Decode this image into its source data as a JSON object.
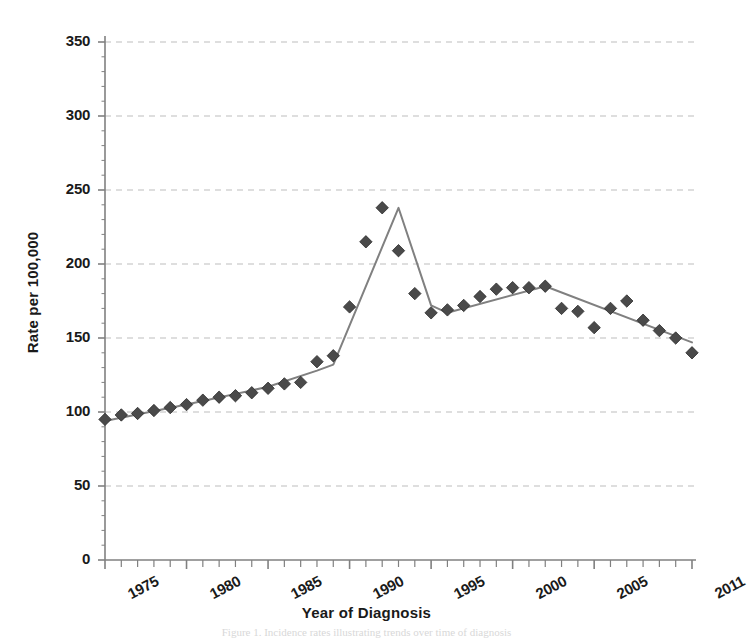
{
  "figure": {
    "background": "#ffffff",
    "caption_remnant": "Figure 1. Incidence rates illustrating trends over time of diagnosis"
  },
  "chart_data": {
    "type": "line",
    "title": "",
    "xlabel": "Year of Diagnosis",
    "ylabel": "Rate per 100,000",
    "xlim": [
      1975,
      2011
    ],
    "ylim": [
      0,
      350
    ],
    "grid": "horizontal-dashed",
    "legend": "none",
    "marker": "diamond",
    "marker_color": "#4a4a4a",
    "line_color": "#808080",
    "axis_color": "#808080",
    "grid_color": "#bdbdbd",
    "ytick_labels": [
      "0",
      "50",
      "100",
      "150",
      "200",
      "250",
      "300",
      "350"
    ],
    "ytick_values": [
      0,
      50,
      100,
      150,
      200,
      250,
      300,
      350
    ],
    "xtick_labels": [
      "1975",
      "1980",
      "1985",
      "1990",
      "1995",
      "2000",
      "2005",
      "2011"
    ],
    "xtick_values": [
      1975,
      1980,
      1985,
      1990,
      1995,
      2000,
      2005,
      2011
    ],
    "x": [
      1975,
      1976,
      1977,
      1978,
      1979,
      1980,
      1981,
      1982,
      1983,
      1984,
      1985,
      1986,
      1987,
      1988,
      1989,
      1990,
      1991,
      1992,
      1993,
      1994,
      1995,
      1996,
      1997,
      1998,
      1999,
      2000,
      2001,
      2002,
      2003,
      2004,
      2005,
      2006,
      2007,
      2008,
      2009,
      2010,
      2011
    ],
    "values": [
      95,
      98,
      99,
      101,
      103,
      105,
      108,
      110,
      111,
      113,
      116,
      119,
      120,
      134,
      138,
      171,
      215,
      238,
      209,
      180,
      167,
      169,
      172,
      178,
      183,
      184,
      184,
      185,
      170,
      168,
      157,
      170,
      175,
      162,
      155,
      150,
      140
    ],
    "series": [
      {
        "name": "Rate per 100,000",
        "values": [
          95,
          98,
          99,
          101,
          103,
          105,
          108,
          110,
          111,
          113,
          116,
          119,
          120,
          134,
          138,
          171,
          215,
          238,
          209,
          180,
          167,
          169,
          172,
          178,
          183,
          184,
          184,
          185,
          170,
          168,
          157,
          170,
          175,
          162,
          155,
          150,
          140
        ]
      }
    ],
    "trend_x": [
      1975,
      1980,
      1985,
      1988,
      1989,
      1993,
      1995,
      1996,
      2002,
      2011
    ],
    "trend_values": [
      94,
      105,
      117,
      128,
      132,
      238,
      172,
      167,
      185,
      147
    ]
  }
}
